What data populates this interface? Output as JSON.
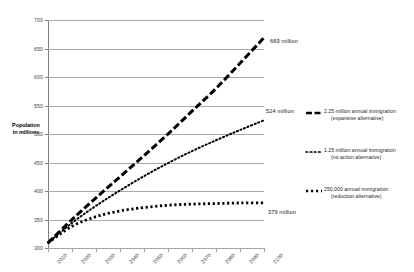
{
  "chart_data": {
    "type": "line",
    "title": "",
    "xlabel": "",
    "ylabel": "Population in millions",
    "ylim": [
      300,
      700
    ],
    "xlim": [
      2010,
      2100
    ],
    "yticks": [
      300,
      350,
      400,
      450,
      500,
      550,
      600,
      650,
      700
    ],
    "grid": true,
    "legend_position": "right",
    "x": [
      2010,
      2020,
      2030,
      2040,
      2050,
      2060,
      2070,
      2080,
      2090,
      2100
    ],
    "series": [
      {
        "name": "2.25 million annual immigration (expansive alternative)",
        "style": "thick-dashed",
        "end_label": "669 million",
        "values": [
          309,
          350,
          388,
          425,
          462,
          500,
          540,
          580,
          624,
          669
        ]
      },
      {
        "name": "1.25 million annual immigration (no action alternative)",
        "style": "dotted",
        "end_label": "524 million",
        "values": [
          309,
          344,
          374,
          401,
          426,
          449,
          470,
          489,
          507,
          524
        ]
      },
      {
        "name": "250,000 annual immigration (reduction alternative)",
        "style": "square-dotted",
        "end_label": "379 million",
        "values": [
          309,
          338,
          355,
          365,
          371,
          375,
          377,
          378,
          379,
          379
        ]
      }
    ],
    "xtick_labels": [
      "2010",
      "2020",
      "2030",
      "2040",
      "2050",
      "2060",
      "2070",
      "2080",
      "2090",
      "2100"
    ],
    "ytick_labels": [
      "300",
      "350",
      "400",
      "450",
      "500",
      "550",
      "600",
      "650",
      "700"
    ]
  },
  "axis": {
    "y_title_line1": "Population",
    "y_title_line2": "in millions"
  },
  "legend": {
    "items": [
      {
        "line1": "2.25 million annual immigration",
        "line2": "(expansive alternative)",
        "style": "thick-dashed"
      },
      {
        "line1": "1.25 million annual immigration",
        "line2": "(no action alternative)",
        "style": "dotted"
      },
      {
        "line1": "250,000 annual immigration",
        "line2": "(reduction alternative)",
        "style": "square-dotted"
      }
    ]
  },
  "annotations": {
    "top": "669 million",
    "middle": "524 million",
    "bottom": "379 million"
  },
  "colors": {
    "series": "#000000",
    "gridline": "#a9a9a9",
    "axis": "#808080",
    "text": "#1a1a1a"
  }
}
